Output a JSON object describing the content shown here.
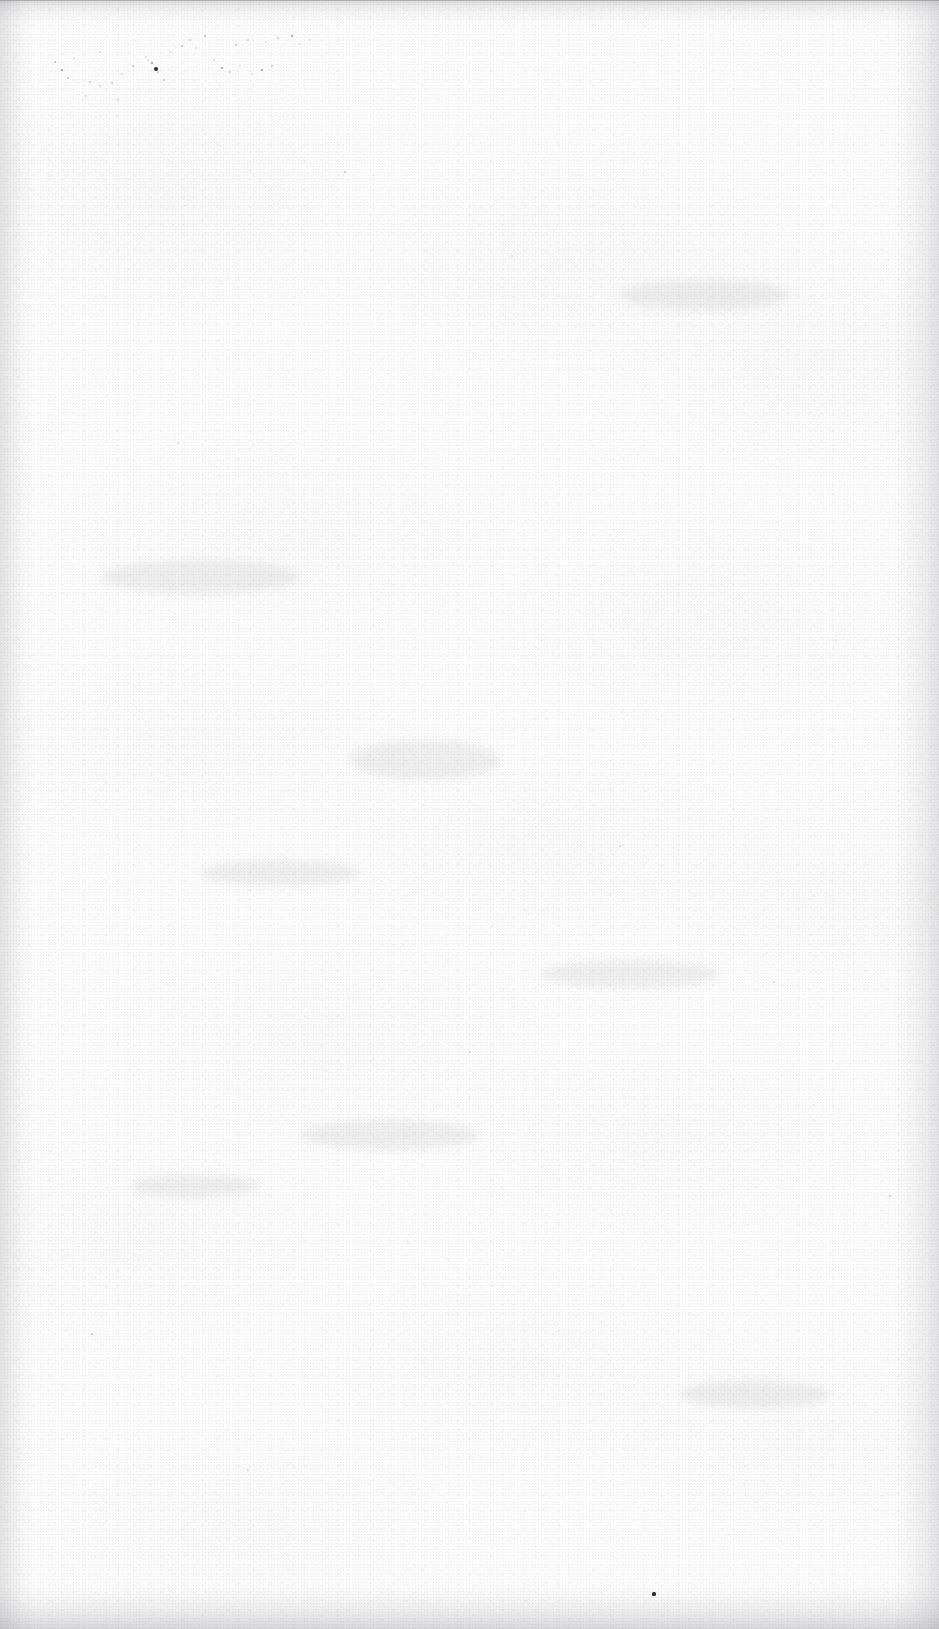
{
  "page": {
    "kind": "scanned-page",
    "state": "blank",
    "width": 939,
    "height": 1629,
    "background_color": "#fdfdfd",
    "paper_tone_color": "#f7f7f8",
    "edge_shadow_color": "#6e6e76",
    "speck_color": "#2b2b2e",
    "visible_text": "",
    "caption": ""
  },
  "artifacts": {
    "label": "scan-artifacts",
    "description": "dust specks and paper grain",
    "speck_clusters": [
      {
        "name": "upper-left-dust-cluster",
        "specks": [
          {
            "x": 55,
            "y": 62,
            "r": 1.1,
            "tone": "faint"
          },
          {
            "x": 62,
            "y": 70,
            "r": 1.4,
            "tone": "soft"
          },
          {
            "x": 68,
            "y": 78,
            "r": 1.0,
            "tone": "faint"
          },
          {
            "x": 74,
            "y": 58,
            "r": 0.9,
            "tone": "vfaint"
          },
          {
            "x": 90,
            "y": 82,
            "r": 1.2,
            "tone": "faint"
          },
          {
            "x": 100,
            "y": 86,
            "r": 1.0,
            "tone": "vfaint"
          },
          {
            "x": 112,
            "y": 83,
            "r": 1.1,
            "tone": "faint"
          },
          {
            "x": 122,
            "y": 74,
            "r": 1.0,
            "tone": "vfaint"
          },
          {
            "x": 133,
            "y": 66,
            "r": 0.9,
            "tone": "faint"
          },
          {
            "x": 146,
            "y": 57,
            "r": 1.0,
            "tone": "vfaint"
          },
          {
            "x": 152,
            "y": 63,
            "r": 1.3,
            "tone": "soft"
          },
          {
            "x": 158,
            "y": 72,
            "r": 1.0,
            "tone": "faint"
          },
          {
            "x": 164,
            "y": 80,
            "r": 1.1,
            "tone": "faint"
          },
          {
            "x": 148,
            "y": 60,
            "r": 1.0,
            "tone": "vfaint"
          },
          {
            "x": 156,
            "y": 69,
            "r": 2.2,
            "tone": "dark"
          },
          {
            "x": 170,
            "y": 52,
            "r": 1.0,
            "tone": "vfaint"
          },
          {
            "x": 182,
            "y": 46,
            "r": 1.2,
            "tone": "faint"
          },
          {
            "x": 190,
            "y": 40,
            "r": 1.1,
            "tone": "faint"
          },
          {
            "x": 196,
            "y": 48,
            "r": 0.9,
            "tone": "vfaint"
          },
          {
            "x": 205,
            "y": 36,
            "r": 1.0,
            "tone": "faint"
          },
          {
            "x": 214,
            "y": 60,
            "r": 1.0,
            "tone": "vfaint"
          },
          {
            "x": 222,
            "y": 68,
            "r": 1.4,
            "tone": "soft"
          },
          {
            "x": 230,
            "y": 72,
            "r": 1.1,
            "tone": "faint"
          },
          {
            "x": 240,
            "y": 66,
            "r": 1.0,
            "tone": "vfaint"
          },
          {
            "x": 236,
            "y": 45,
            "r": 1.2,
            "tone": "faint"
          },
          {
            "x": 248,
            "y": 40,
            "r": 1.1,
            "tone": "faint"
          },
          {
            "x": 252,
            "y": 74,
            "r": 1.0,
            "tone": "vfaint"
          },
          {
            "x": 262,
            "y": 70,
            "r": 1.3,
            "tone": "soft"
          },
          {
            "x": 272,
            "y": 66,
            "r": 1.1,
            "tone": "faint"
          },
          {
            "x": 266,
            "y": 42,
            "r": 1.0,
            "tone": "vfaint"
          },
          {
            "x": 278,
            "y": 38,
            "r": 1.1,
            "tone": "faint"
          },
          {
            "x": 292,
            "y": 36,
            "r": 1.4,
            "tone": "soft"
          },
          {
            "x": 300,
            "y": 44,
            "r": 1.0,
            "tone": "vfaint"
          },
          {
            "x": 310,
            "y": 40,
            "r": 1.0,
            "tone": "vfaint"
          },
          {
            "x": 86,
            "y": 96,
            "r": 0.9,
            "tone": "vfaint"
          },
          {
            "x": 118,
            "y": 100,
            "r": 0.9,
            "tone": "vfaint"
          },
          {
            "x": 100,
            "y": 52,
            "r": 0.9,
            "tone": "vfaint"
          }
        ]
      },
      {
        "name": "scattered-specks",
        "specks": [
          {
            "x": 345,
            "y": 172,
            "r": 1.1,
            "tone": "faint"
          },
          {
            "x": 654,
            "y": 1594,
            "r": 1.6,
            "tone": "dark"
          },
          {
            "x": 890,
            "y": 1196,
            "r": 1.2,
            "tone": "faint"
          },
          {
            "x": 512,
            "y": 256,
            "r": 1.0,
            "tone": "vfaint"
          },
          {
            "x": 178,
            "y": 443,
            "r": 1.0,
            "tone": "vfaint"
          },
          {
            "x": 92,
            "y": 1334,
            "r": 1.1,
            "tone": "faint"
          },
          {
            "x": 774,
            "y": 982,
            "r": 0.9,
            "tone": "vfaint"
          },
          {
            "x": 408,
            "y": 1242,
            "r": 0.9,
            "tone": "vfaint"
          },
          {
            "x": 620,
            "y": 846,
            "r": 0.9,
            "tone": "vfaint"
          },
          {
            "x": 248,
            "y": 1470,
            "r": 0.9,
            "tone": "vfaint"
          },
          {
            "x": 836,
            "y": 640,
            "r": 0.9,
            "tone": "vfaint"
          },
          {
            "x": 470,
            "y": 1052,
            "r": 0.9,
            "tone": "vfaint"
          }
        ]
      }
    ],
    "showthrough_smudges": [
      {
        "x": 130,
        "y": 1175,
        "w": 130,
        "h": 22
      },
      {
        "x": 300,
        "y": 1120,
        "w": 180,
        "h": 30
      },
      {
        "x": 350,
        "y": 740,
        "w": 150,
        "h": 40
      },
      {
        "x": 540,
        "y": 960,
        "w": 180,
        "h": 28
      },
      {
        "x": 100,
        "y": 560,
        "w": 200,
        "h": 34
      },
      {
        "x": 620,
        "y": 280,
        "w": 170,
        "h": 30
      },
      {
        "x": 200,
        "y": 860,
        "w": 160,
        "h": 26
      },
      {
        "x": 680,
        "y": 1380,
        "w": 150,
        "h": 28
      }
    ]
  }
}
